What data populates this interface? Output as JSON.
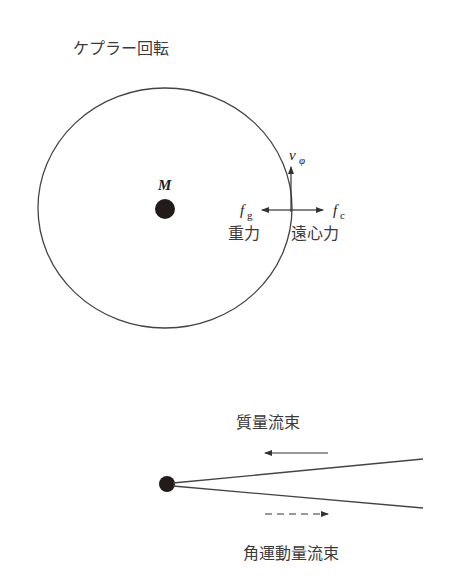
{
  "diagram": {
    "title": "ケプラー回転",
    "kepler": {
      "central_mass_label": "M",
      "velocity_label": "v",
      "velocity_subscript": "φ",
      "gravity_symbol": "f",
      "gravity_subscript": "g",
      "gravity_label": "重力",
      "centrifugal_symbol": "f",
      "centrifugal_subscript": "c",
      "centrifugal_label": "遠心力"
    },
    "disk": {
      "mass_flux_label": "質量流束",
      "angular_momentum_flux_label": "角運動量流束"
    },
    "colors": {
      "line": "#333333",
      "dot": "#231a1a",
      "text": "#3a3a3a"
    }
  }
}
